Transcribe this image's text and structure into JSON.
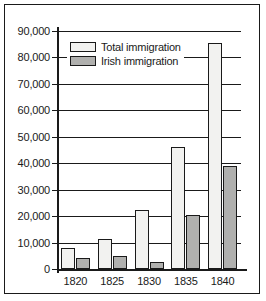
{
  "chart_data": {
    "type": "bar",
    "title": "",
    "xlabel": "",
    "ylabel": "",
    "categories": [
      "1820",
      "1825",
      "1830",
      "1835",
      "1840"
    ],
    "series": [
      {
        "name": "Total immigration",
        "color": "#f2f2f0",
        "values": [
          8000,
          11500,
          22500,
          46000,
          85500
        ]
      },
      {
        "name": "Irish immigration",
        "color": "#b0b0ae",
        "values": [
          4000,
          5000,
          2500,
          20500,
          39000
        ]
      }
    ],
    "ylim": [
      0,
      90000
    ],
    "ytick_values": [
      0,
      10000,
      20000,
      30000,
      40000,
      50000,
      60000,
      70000,
      80000,
      90000
    ],
    "ytick_labels": [
      "0",
      "10,000",
      "20,000",
      "30,000",
      "40,000",
      "50,000",
      "60,000",
      "70,000",
      "80,000",
      "90,000"
    ],
    "grid": true,
    "legend_position": "top-left",
    "legend_entries": [
      "Total immigration",
      "Irish immigration"
    ]
  }
}
